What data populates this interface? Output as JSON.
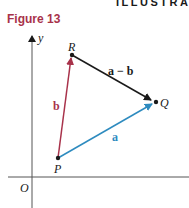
{
  "header": {
    "text": "ILLUSTRATI"
  },
  "figure": {
    "title": "Figure 13"
  },
  "diagram": {
    "axes": {
      "y_label": "y",
      "origin_label": "O"
    },
    "points": {
      "R": {
        "label": "R"
      },
      "Q": {
        "label": "Q"
      },
      "P": {
        "label": "P"
      }
    },
    "vectors": {
      "b": {
        "label": "b",
        "color": "#a8324a"
      },
      "a": {
        "label": "a",
        "color": "#2e8bbf"
      },
      "a_minus_b": {
        "label": "a − b",
        "color": "#1a1a1a"
      }
    }
  }
}
